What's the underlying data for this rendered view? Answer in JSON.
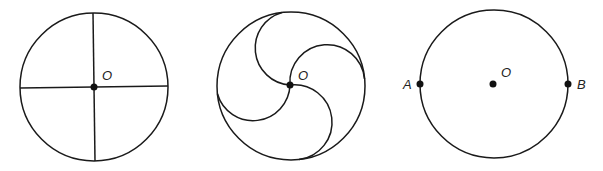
{
  "figures": [
    {
      "id": "circle-with-diameters",
      "center_label": "O",
      "center": [
        94,
        87
      ],
      "radius": 74
    },
    {
      "id": "circle-with-pinwheel-arcs",
      "center_label": "O",
      "center": [
        291,
        86
      ],
      "radius": 74
    },
    {
      "id": "circle-with-points",
      "center_label": "O",
      "point_a_label": "A",
      "point_b_label": "B",
      "center": [
        493,
        84
      ],
      "radius": 74
    }
  ],
  "colors": {
    "line": "#1a1a1a",
    "background": "#ffffff"
  }
}
